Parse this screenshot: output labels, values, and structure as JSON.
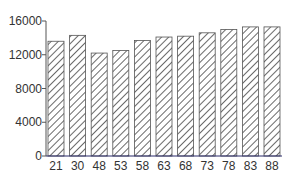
{
  "chart_data": {
    "type": "bar",
    "title": "",
    "xlabel": "",
    "ylabel": "",
    "categories": [
      "21",
      "30",
      "48",
      "53",
      "58",
      "63",
      "68",
      "73",
      "78",
      "83",
      "88"
    ],
    "values": [
      13600,
      14300,
      12200,
      12500,
      13700,
      14100,
      14200,
      14600,
      15000,
      15300,
      15300
    ],
    "ylim": [
      0,
      16000
    ],
    "yticks": [
      0,
      4000,
      8000,
      12000,
      16000
    ],
    "grid": false,
    "legend": null,
    "bar_style": "diagonal-hatch"
  },
  "colors": {
    "bar_fill": "#ffffff",
    "hatch": "#444444",
    "bar_edge": "#555555",
    "axis": "#555555",
    "baseline": "#2a2a6a"
  }
}
